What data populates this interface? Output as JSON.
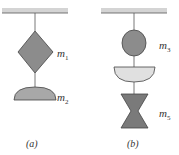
{
  "figure": {
    "panels": [
      {
        "caption": "(a)",
        "masses": [
          {
            "label": "m",
            "subscript": "1",
            "shape": "diamond"
          },
          {
            "label": "m",
            "subscript": "2",
            "shape": "dome"
          }
        ]
      },
      {
        "caption": "(b)",
        "masses": [
          {
            "label": "m",
            "subscript": "3",
            "shape": "circle"
          },
          {
            "label": "",
            "subscript": "",
            "shape": "bowl"
          },
          {
            "label": "m",
            "subscript": "5",
            "shape": "hourglass"
          }
        ]
      }
    ],
    "colors": {
      "ceiling": "#d4d4d4",
      "ceiling_edge": "#555555",
      "dark_fill": "#8c8c8c",
      "light_fill": "#dcdcdc",
      "stroke": "#444444"
    }
  }
}
